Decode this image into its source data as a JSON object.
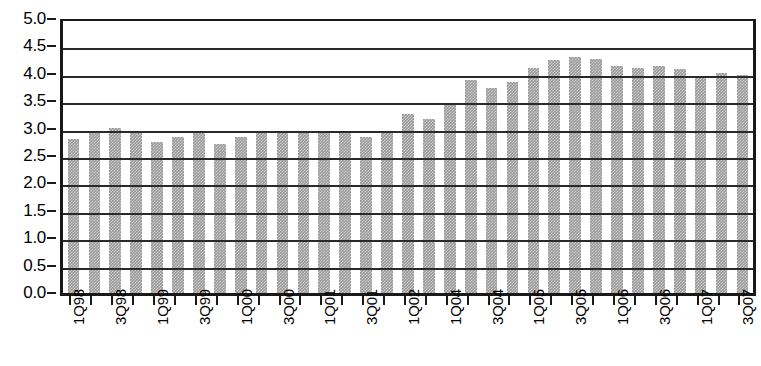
{
  "chart_data": {
    "type": "bar",
    "title": "",
    "xlabel": "",
    "ylabel": "",
    "ylim": [
      0.0,
      5.0
    ],
    "ytick_step": 0.5,
    "grid": true,
    "legend": null,
    "y_ticks": [
      "0.0",
      "0.5",
      "1.0",
      "1.5",
      "2.0",
      "2.5",
      "3.0",
      "3.5",
      "4.0",
      "4.5",
      "5.0"
    ],
    "bar_color": "#9a9a9a",
    "axis_color": "#1a1a1a",
    "categories": [
      "1Q98",
      "2Q98",
      "3Q98",
      "4Q98",
      "1Q99",
      "2Q99",
      "3Q99",
      "4Q99",
      "1Q00",
      "2Q00",
      "3Q00",
      "4Q00",
      "1Q01",
      "2Q01",
      "3Q01",
      "4Q01",
      "1Q02",
      "2Q02",
      "1Q04",
      "2Q04",
      "3Q04",
      "4Q04",
      "1Q05",
      "2Q05",
      "3Q05",
      "4Q05",
      "1Q06",
      "2Q06",
      "3Q06",
      "4Q06",
      "1Q07",
      "2Q07",
      "3Q07"
    ],
    "tick_labels": [
      "1Q98",
      "",
      "3Q98",
      "",
      "1Q99",
      "",
      "3Q99",
      "",
      "1Q00",
      "",
      "3Q00",
      "",
      "1Q01",
      "",
      "3Q01",
      "",
      "1Q02",
      "",
      "1Q04",
      "",
      "3Q04",
      "",
      "1Q05",
      "",
      "3Q05",
      "",
      "1Q06",
      "",
      "3Q06",
      "",
      "1Q07",
      "",
      "3Q07"
    ],
    "values": [
      2.85,
      2.95,
      3.05,
      2.97,
      2.8,
      2.88,
      2.95,
      2.75,
      2.88,
      2.98,
      2.98,
      2.97,
      2.98,
      2.96,
      2.88,
      2.98,
      3.3,
      3.22,
      3.48,
      3.92,
      3.78,
      3.88,
      4.15,
      4.28,
      4.35,
      4.3,
      4.18,
      4.15,
      4.18,
      4.12,
      4.0,
      4.05,
      4.02
    ]
  }
}
